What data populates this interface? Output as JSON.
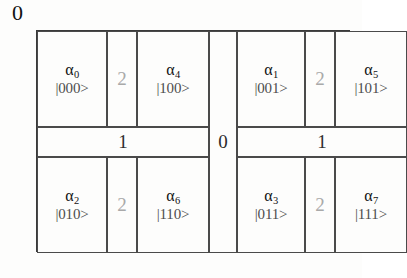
{
  "figure": {
    "type": "binary-partition-grid",
    "axis_label_top": "0",
    "description_semantics": {
      "split_dim_outer_vertical": "0",
      "split_dim_horizontal": "1",
      "split_dim_inner_vertical": "2"
    }
  },
  "dividers": {
    "center_vertical": "0",
    "band_left": "1",
    "band_right": "1",
    "inner_top_left": "2",
    "inner_top_right": "2",
    "inner_bottom_left": "2",
    "inner_bottom_right": "2"
  },
  "cells": [
    {
      "id": "a0",
      "symbol": "α",
      "index": "0",
      "ket": "|000>",
      "row": "top",
      "half": "left",
      "side": "outer"
    },
    {
      "id": "a4",
      "symbol": "α",
      "index": "4",
      "ket": "|100>",
      "row": "top",
      "half": "left",
      "side": "inner"
    },
    {
      "id": "a1",
      "symbol": "α",
      "index": "1",
      "ket": "|001>",
      "row": "top",
      "half": "right",
      "side": "outer"
    },
    {
      "id": "a5",
      "symbol": "α",
      "index": "5",
      "ket": "|101>",
      "row": "top",
      "half": "right",
      "side": "inner"
    },
    {
      "id": "a2",
      "symbol": "α",
      "index": "2",
      "ket": "|010>",
      "row": "bottom",
      "half": "left",
      "side": "outer"
    },
    {
      "id": "a6",
      "symbol": "α",
      "index": "6",
      "ket": "|110>",
      "row": "bottom",
      "half": "left",
      "side": "inner"
    },
    {
      "id": "a3",
      "symbol": "α",
      "index": "3",
      "ket": "|011>",
      "row": "bottom",
      "half": "right",
      "side": "outer"
    },
    {
      "id": "a7",
      "symbol": "α",
      "index": "7",
      "ket": "|111>",
      "row": "bottom",
      "half": "right",
      "side": "inner"
    }
  ],
  "colors": {
    "background": "#fdfdfc",
    "border": "#3a3a3a",
    "cell_border": "#4a4a4a",
    "symbol_text": "#111111",
    "ket_text": "#4e4e4e",
    "divider_digit": "#a9a9a9",
    "band_digit": "#2f2f2f"
  }
}
